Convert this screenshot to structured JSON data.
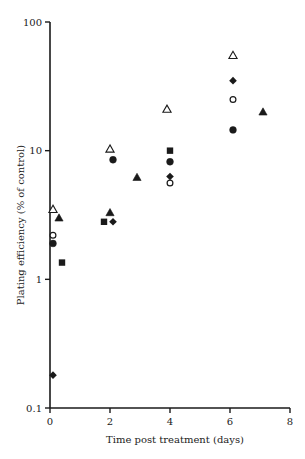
{
  "chart_data": {
    "type": "scatter",
    "title": "",
    "xlabel": "Time post treatment (days)",
    "ylabel": "Plating efficiency  (% of control)",
    "xlim": [
      0,
      8
    ],
    "ylim": [
      0.1,
      100
    ],
    "yscale": "log",
    "xticks": [
      0,
      2,
      4,
      6,
      8
    ],
    "xtick_labels": [
      "0",
      "2",
      "4",
      "6",
      "8"
    ],
    "yticks": [
      0.1,
      1,
      10,
      100
    ],
    "ytick_labels": [
      "0.1",
      "1",
      "10",
      "100"
    ],
    "grid": false,
    "legend": "none",
    "series": [
      {
        "name": "open-triangle",
        "marker": "triangle-open",
        "points": [
          [
            0.1,
            3.5
          ],
          [
            2.0,
            10.3
          ],
          [
            3.9,
            21
          ],
          [
            6.1,
            55
          ]
        ]
      },
      {
        "name": "filled-triangle",
        "marker": "triangle-filled",
        "points": [
          [
            0.3,
            3.0
          ],
          [
            2.0,
            3.3
          ],
          [
            2.9,
            6.2
          ],
          [
            7.1,
            20
          ]
        ]
      },
      {
        "name": "open-circle",
        "marker": "circle-open",
        "points": [
          [
            0.1,
            2.2
          ],
          [
            4.0,
            5.6
          ],
          [
            6.1,
            25
          ]
        ]
      },
      {
        "name": "filled-circle",
        "marker": "circle-filled",
        "points": [
          [
            0.1,
            1.9
          ],
          [
            2.1,
            8.5
          ],
          [
            4.0,
            8.2
          ],
          [
            6.1,
            14.5
          ]
        ]
      },
      {
        "name": "filled-square",
        "marker": "square-filled",
        "points": [
          [
            0.4,
            1.35
          ],
          [
            1.8,
            2.8
          ],
          [
            4.0,
            10
          ]
        ]
      },
      {
        "name": "filled-diamond",
        "marker": "diamond-filled",
        "points": [
          [
            0.1,
            0.18
          ],
          [
            2.1,
            2.8
          ],
          [
            4.0,
            6.3
          ],
          [
            6.1,
            35
          ]
        ]
      }
    ],
    "colors": {
      "ink": "#1a1a1a",
      "background": "#ffffff"
    }
  }
}
